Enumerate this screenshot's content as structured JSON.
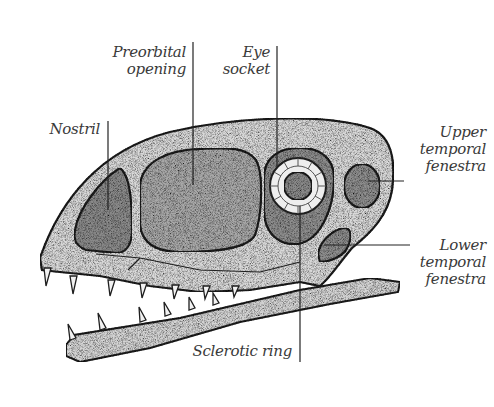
{
  "diagram": {
    "labels": {
      "nostril": "Nostril",
      "preorbital_opening": "Preorbital\nopening",
      "eye_socket": "Eye\nsocket",
      "upper_temporal_fenestra": "Upper\ntemporal\nfenestra",
      "lower_temporal_fenestra": "Lower\ntemporal\nfenestra",
      "sclerotic_ring": "Sclerotic ring"
    },
    "colors": {
      "bone": "#d9d9d9",
      "opening": "#8e8e8e",
      "outline": "#1e1e1e",
      "leader_line": "#222222",
      "label_text": "#3a3a3a"
    }
  }
}
